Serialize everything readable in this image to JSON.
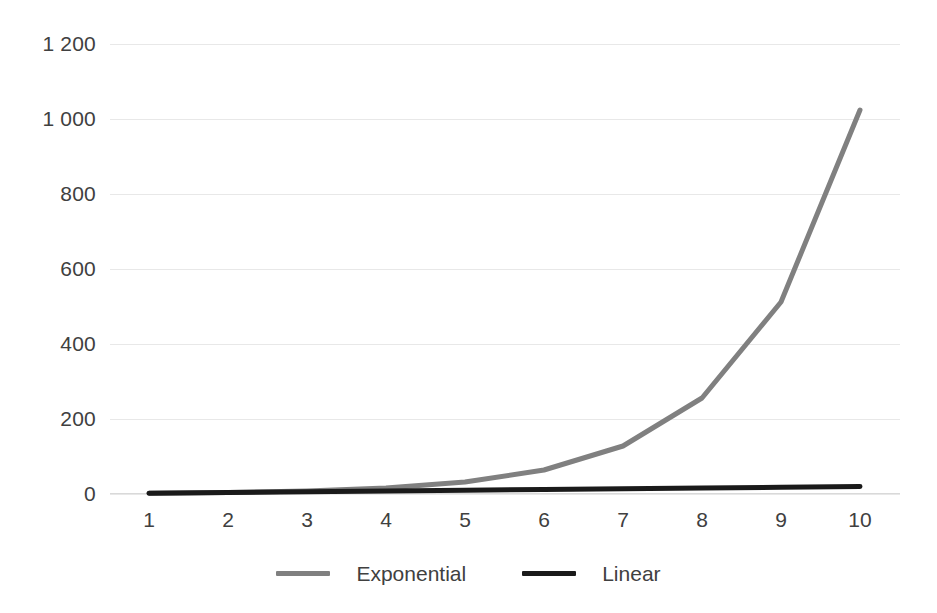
{
  "chart_data": {
    "type": "line",
    "title": "",
    "xlabel": "",
    "ylabel": "",
    "x": [
      1,
      2,
      3,
      4,
      5,
      6,
      7,
      8,
      9,
      10
    ],
    "categories": [
      "1",
      "2",
      "3",
      "4",
      "5",
      "6",
      "7",
      "8",
      "9",
      "10"
    ],
    "series": [
      {
        "name": "Exponential",
        "color": "#808080",
        "values": [
          2,
          4,
          8,
          16,
          32,
          64,
          128,
          256,
          512,
          1024
        ]
      },
      {
        "name": "Linear",
        "color": "#1a1a1a",
        "values": [
          2,
          4,
          6,
          8,
          10,
          12,
          14,
          16,
          18,
          20
        ]
      }
    ],
    "ylim": [
      0,
      1200
    ],
    "yticks": [
      0,
      200,
      400,
      600,
      800,
      1000,
      1200
    ],
    "ytick_labels": [
      "0",
      "200",
      "400",
      "600",
      "800",
      "1 000",
      "1 200"
    ],
    "xtick_labels": [
      "1",
      "2",
      "3",
      "4",
      "5",
      "6",
      "7",
      "8",
      "9",
      "10"
    ],
    "grid": true,
    "grid_color": "#e8e8e8",
    "legend_position": "bottom",
    "background": "#ffffff"
  },
  "legend": {
    "items": [
      {
        "label": "Exponential",
        "color": "#808080"
      },
      {
        "label": "Linear",
        "color": "#1a1a1a"
      }
    ]
  },
  "axes": {
    "y_labels": [
      "1 200",
      "1 000",
      "800",
      "600",
      "400",
      "200",
      "0"
    ],
    "x_labels": [
      "1",
      "2",
      "3",
      "4",
      "5",
      "6",
      "7",
      "8",
      "9",
      "10"
    ]
  }
}
